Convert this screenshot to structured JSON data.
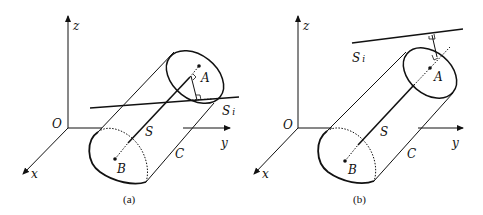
{
  "figure": {
    "panels": [
      {
        "id": "a",
        "caption": "(a)",
        "labels": {
          "z": "z",
          "y": "y",
          "x": "x",
          "origin": "O",
          "axis_line": "S",
          "cylinder": "C",
          "point_top": "A",
          "point_bottom": "B",
          "line_main": "S",
          "line_sub": "i"
        },
        "description": "Cylinder C with axis S between A and B; line S_i crosses through the cylinder, with a perpendicular foot from the axis near A."
      },
      {
        "id": "b",
        "caption": "(b)",
        "labels": {
          "z": "z",
          "y": "y",
          "x": "x",
          "origin": "O",
          "axis_line": "S",
          "cylinder": "C",
          "point_top": "A",
          "point_bottom": "B",
          "line_main": "S",
          "line_sub": "i"
        },
        "description": "Cylinder C with axis S between A and B; line S_i lies outside the cylinder above it, with a perpendicular from the extended axis."
      }
    ],
    "colors": {
      "stroke": "#111111",
      "background": "#ffffff"
    }
  }
}
